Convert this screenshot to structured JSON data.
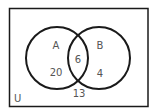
{
  "diagram": {
    "type": "venn",
    "universe_label": "U",
    "sets": [
      {
        "label": "A",
        "only_count": "20"
      },
      {
        "label": "B",
        "only_count": "4"
      }
    ],
    "intersection_count": "6",
    "outside_count": "13",
    "colors": {
      "stroke": "#1a1a1a",
      "text": "#555555",
      "background": "#ffffff"
    }
  }
}
